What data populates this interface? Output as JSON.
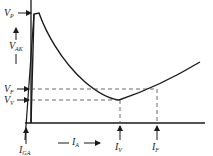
{
  "diagram": {
    "type": "characteristic-curve",
    "colors": {
      "ink": "#1a1a1a",
      "background": "#ffffff"
    },
    "y_axis": {
      "label": "V",
      "label_sub": "AK"
    },
    "x_axis": {
      "label": "I",
      "label_sub": "A"
    },
    "labels": {
      "vp": {
        "main": "V",
        "sub": "P"
      },
      "vf": {
        "main": "V",
        "sub": "F"
      },
      "vv": {
        "main": "V",
        "sub": "V"
      },
      "iga": {
        "main": "I",
        "sub": "GA"
      },
      "iv": {
        "main": "I",
        "sub": "V"
      },
      "if": {
        "main": "I",
        "sub": "F"
      }
    }
  }
}
